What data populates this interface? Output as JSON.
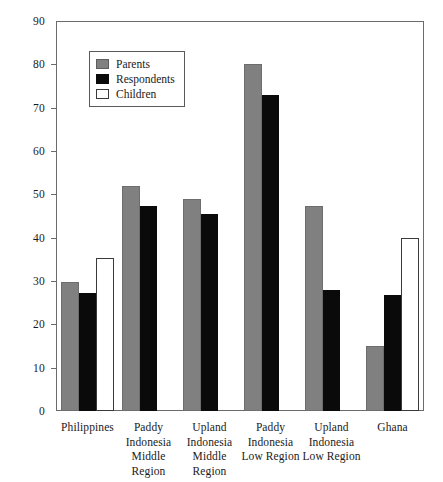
{
  "chart_data": {
    "type": "bar",
    "title": "",
    "xlabel": "",
    "ylabel": "",
    "ylim": [
      0,
      90
    ],
    "y_ticks": [
      0,
      10,
      20,
      30,
      40,
      50,
      60,
      70,
      80,
      90
    ],
    "grid": false,
    "legend_position": "top-left-inside",
    "categories": [
      "Philippines",
      "Paddy Indonesia Middle Region",
      "Upland Indonesia Middle Region",
      "Paddy Indonesia Low Region",
      "Upland Indonesia Low Region",
      "Ghana"
    ],
    "category_lines": [
      [
        "Philippines"
      ],
      [
        "Paddy",
        "Indonesia",
        "Middle",
        "Region"
      ],
      [
        "Upland",
        "Indonesia",
        "Middle",
        "Region"
      ],
      [
        "Paddy",
        "Indonesia",
        "Low Region"
      ],
      [
        "Upland",
        "Indonesia",
        "Low Region"
      ],
      [
        "Ghana"
      ]
    ],
    "series": [
      {
        "name": "Parents",
        "color": "#808080",
        "values": [
          29.7,
          52,
          49,
          80,
          47.3,
          15
        ]
      },
      {
        "name": "Respondents",
        "color": "#0a0a0a",
        "values": [
          27.3,
          47.3,
          45.5,
          73,
          27.9,
          26.8
        ]
      },
      {
        "name": "Children",
        "color": "#ffffff",
        "values": [
          35.2,
          null,
          null,
          null,
          null,
          40
        ]
      }
    ]
  },
  "legend": {
    "items": [
      {
        "label": "Parents",
        "swatch": "parents"
      },
      {
        "label": "Respondents",
        "swatch": "respondents"
      },
      {
        "label": "Children",
        "swatch": "children"
      }
    ]
  }
}
